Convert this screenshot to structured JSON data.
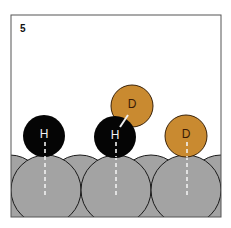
{
  "panel": {
    "label": "5"
  },
  "colors": {
    "frame": "#555555",
    "surface": "#a3a3a3",
    "surface_outline": "#1a1a1a",
    "hydrogen_fill": "#050505",
    "hydrogen_text": "#f2f2f2",
    "deuterium_fill": "#c98a30",
    "deuterium_outline": "#3a2208",
    "deuterium_text": "#3a1a05",
    "dashed_line": "#f0f0f0"
  },
  "atoms": [
    {
      "symbol": "H",
      "type": "hydrogen",
      "position": "adsorbed-left"
    },
    {
      "symbol": "H",
      "type": "hydrogen",
      "position": "adsorbed-center"
    },
    {
      "symbol": "D",
      "type": "deuterium",
      "position": "desorbing-bonded-to-center-H"
    },
    {
      "symbol": "D",
      "type": "deuterium",
      "position": "adsorbed-right"
    }
  ]
}
